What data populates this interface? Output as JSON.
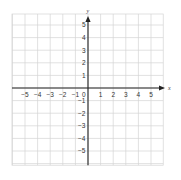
{
  "diagram": {
    "type": "coordinate-plane",
    "x_axis": {
      "label": "x",
      "min": -5,
      "max": 5,
      "ticks": [
        -5,
        -4,
        -3,
        -2,
        -1,
        1,
        2,
        3,
        4,
        5
      ]
    },
    "y_axis": {
      "label": "y",
      "min": -5,
      "max": 5,
      "ticks": [
        5,
        4,
        3,
        2,
        1,
        -1,
        -2,
        -3,
        -4,
        -5
      ]
    },
    "origin_label": "0",
    "grid": {
      "columns": 12,
      "rows": 12
    },
    "colors": {
      "grid": "#d4d4d4",
      "axis": "#222222",
      "labels": "#333333",
      "background": "#ffffff"
    }
  }
}
